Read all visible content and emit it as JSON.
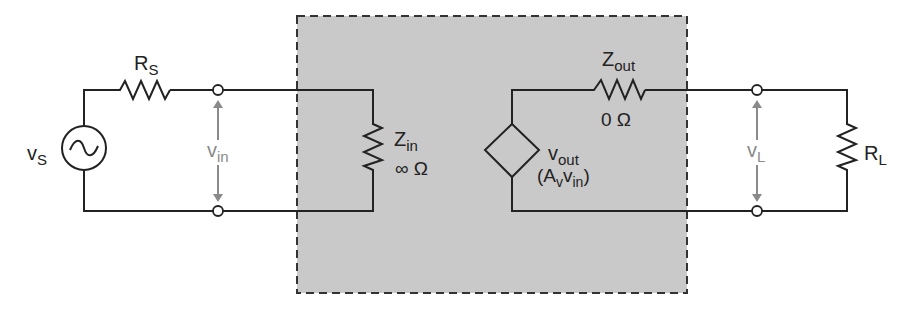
{
  "diagram": {
    "type": "circuit",
    "title": "",
    "colors": {
      "wire": "#222222",
      "amplifier_box_fill": "#c9c9c9",
      "amplifier_box_border": "#333333",
      "voltage_annotation": "#8a8a8a",
      "terminal_fill": "#ffffff"
    },
    "source": {
      "symbol": "ac-voltage-source",
      "label_main": "v",
      "label_sub": "S"
    },
    "source_resistor": {
      "label_main": "R",
      "label_sub": "S"
    },
    "input_voltage": {
      "label_main": "v",
      "label_sub": "in"
    },
    "amplifier": {
      "input_impedance": {
        "label_main": "Z",
        "label_sub": "in",
        "value": "∞ Ω"
      },
      "dependent_source": {
        "symbol": "dependent-voltage-source",
        "label_main": "v",
        "label_sub": "out",
        "expr_open": "(A",
        "expr_sub1": "v",
        "expr_mid": "v",
        "expr_sub2": "in",
        "expr_close": ")"
      },
      "output_impedance": {
        "label_main": "Z",
        "label_sub": "out",
        "value": "0 Ω"
      }
    },
    "load_voltage": {
      "label_main": "v",
      "label_sub": "L"
    },
    "load_resistor": {
      "label_main": "R",
      "label_sub": "L"
    }
  }
}
